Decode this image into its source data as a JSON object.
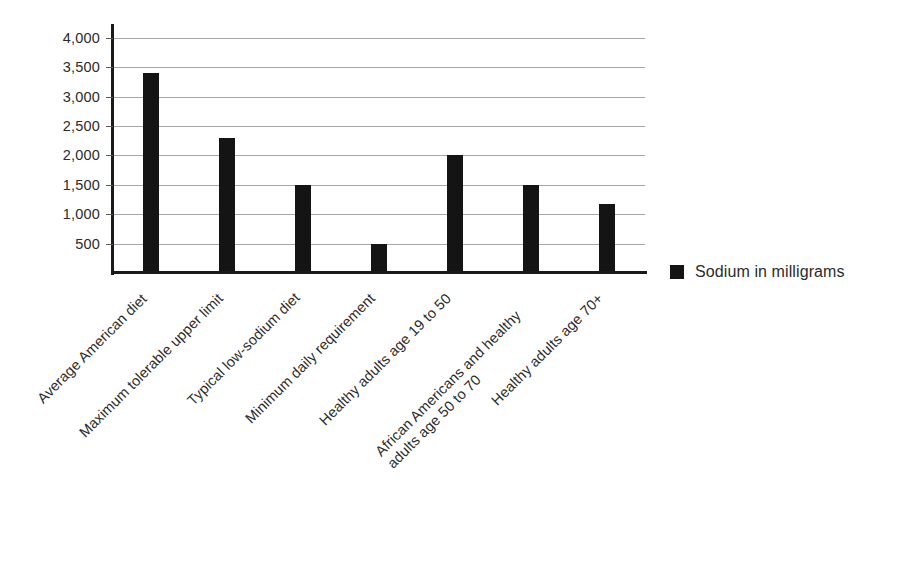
{
  "chart_data": {
    "type": "bar",
    "title": "",
    "subtitle": "",
    "xlabel": "",
    "ylabel": "",
    "ylim": [
      0,
      4200
    ],
    "grid": true,
    "legend_position": "right",
    "orientation": "vertical",
    "bar_color": "#141414",
    "gridline_color": "#a6a6a6",
    "axis_color": "#1a1a1a",
    "background_color": "#ffffff",
    "y_ticks": [
      500,
      1000,
      1500,
      2000,
      2500,
      3000,
      3500,
      4000
    ],
    "y_tick_labels": [
      "500",
      "1,000",
      "1,500",
      "2,000",
      "2,500",
      "3,000",
      "3,500",
      "4,000"
    ],
    "categories": [
      "Average American diet",
      "Maximum tolerable upper limit",
      "Typical low-sodium diet",
      "Minimum daily requirement",
      "Healthy adults age 19 to 50",
      "African Americans and healthy\nadults age 50 to 70",
      "Healthy adults age 70+"
    ],
    "series": [
      {
        "name": "Sodium in milligrams",
        "values": [
          3400,
          2300,
          1500,
          500,
          2000,
          1500,
          1170
        ]
      }
    ],
    "legend": [
      {
        "label": "Sodium in milligrams",
        "color": "#141414",
        "marker": "square"
      }
    ]
  }
}
